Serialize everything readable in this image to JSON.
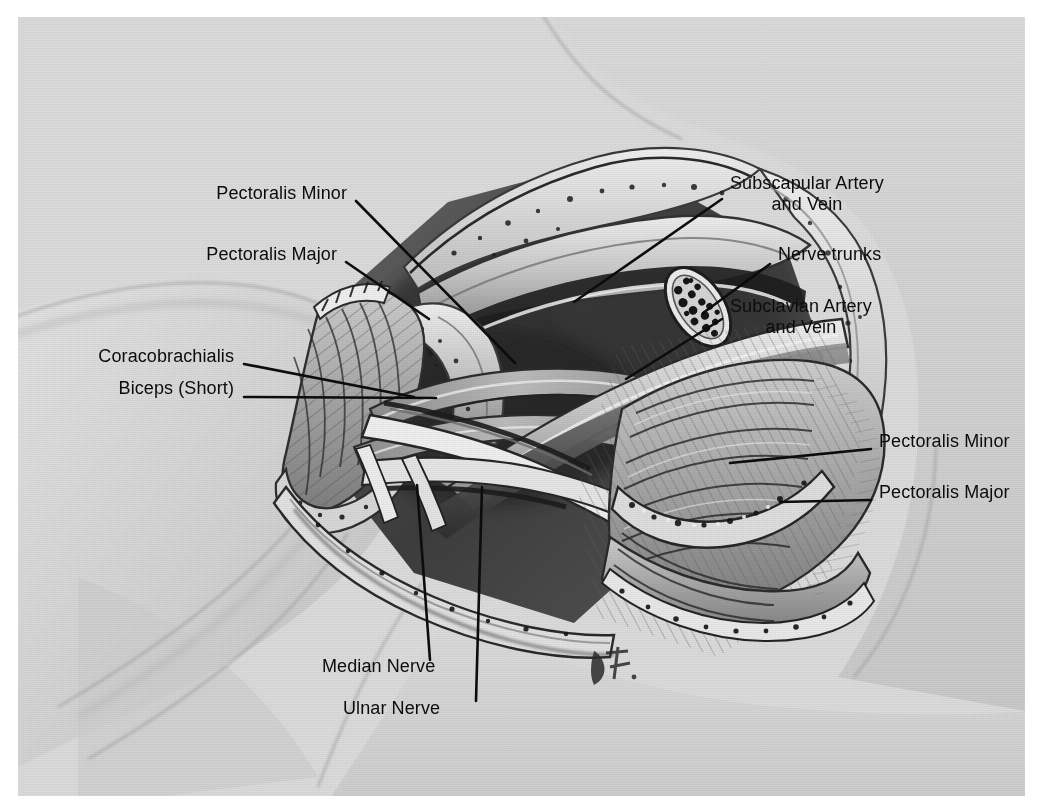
{
  "figure": {
    "domain": "anatomical-illustration",
    "medium": "grayscale halftone wash drawing",
    "signature": "B7",
    "background_color": "#dcdcdc",
    "ink_color": "#0c0c0c",
    "plate": {
      "x": 18,
      "y": 17,
      "width": 1007,
      "height": 779
    }
  },
  "labels": [
    {
      "id": "pectoralis-minor-left",
      "text": "Pectoralis Minor",
      "align": "right",
      "text_x": 329,
      "text_y": 175,
      "leader": [
        [
          338,
          184
        ],
        [
          497,
          346
        ]
      ]
    },
    {
      "id": "pectoralis-major-left",
      "text": "Pectoralis Major",
      "align": "right",
      "text_x": 319,
      "text_y": 236,
      "leader": [
        [
          328,
          245
        ],
        [
          411,
          302
        ]
      ]
    },
    {
      "id": "coracobrachialis",
      "text": "Coracobrachialis",
      "align": "right",
      "text_x": 216,
      "text_y": 338,
      "leader": [
        [
          226,
          347
        ],
        [
          396,
          380
        ]
      ]
    },
    {
      "id": "biceps-short",
      "text": "Biceps (Short)",
      "align": "right",
      "text_x": 216,
      "text_y": 370,
      "leader": [
        [
          226,
          380
        ],
        [
          418,
          381
        ]
      ]
    },
    {
      "id": "subscapular-artery-and-vein",
      "text": "Subscapular Artery\nand Vein",
      "align": "left",
      "text_x": 712,
      "text_y": 165,
      "leader": [
        [
          704,
          182
        ],
        [
          556,
          285
        ]
      ]
    },
    {
      "id": "nerve-trunks",
      "text": "Nerve trunks",
      "align": "left",
      "text_x": 760,
      "text_y": 236,
      "leader": [
        [
          752,
          247
        ],
        [
          685,
          296
        ]
      ]
    },
    {
      "id": "subclavian-artery-and-vein",
      "text": "Subclavian Artery\nand Vein",
      "align": "left",
      "text_x": 712,
      "text_y": 288,
      "leader": [
        [
          704,
          302
        ],
        [
          608,
          362
        ]
      ]
    },
    {
      "id": "pectoralis-minor-right",
      "text": "Pectoralis Minor",
      "align": "left",
      "text_x": 861,
      "text_y": 423,
      "leader": [
        [
          853,
          432
        ],
        [
          712,
          446
        ]
      ]
    },
    {
      "id": "pectoralis-major-right",
      "text": "Pectoralis Major",
      "align": "left",
      "text_x": 861,
      "text_y": 474,
      "leader": [
        [
          853,
          483
        ],
        [
          762,
          485
        ]
      ]
    },
    {
      "id": "median-nerve",
      "text": "Median Nerve",
      "align": "left",
      "text_x": 324,
      "text_y": 648,
      "leader": [
        [
          412,
          643
        ],
        [
          399,
          468
        ]
      ]
    },
    {
      "id": "ulnar-nerve",
      "text": "Ulnar Nerve",
      "align": "left",
      "text_x": 345,
      "text_y": 690,
      "leader": [
        [
          458,
          684
        ],
        [
          464,
          470
        ]
      ]
    }
  ],
  "structures": [
    {
      "id": "clavicle",
      "name": "clavicle"
    },
    {
      "id": "pectoralis-major-flap-left",
      "name": "reflected pectoralis major flap (left)"
    },
    {
      "id": "pectoralis-minor-stump",
      "name": "pectoralis minor stump"
    },
    {
      "id": "axillary-vessels",
      "name": "axillary artery and vein"
    },
    {
      "id": "brachial-plexus-cords",
      "name": "brachial plexus cords"
    },
    {
      "id": "nerve-trunk-cross-section",
      "name": "cut nerve trunk cross-section"
    },
    {
      "id": "pectoral-flap-right",
      "name": "reflected pectoral muscle flap (right)"
    },
    {
      "id": "skin-edge",
      "name": "retracted skin and fascia edge"
    }
  ]
}
